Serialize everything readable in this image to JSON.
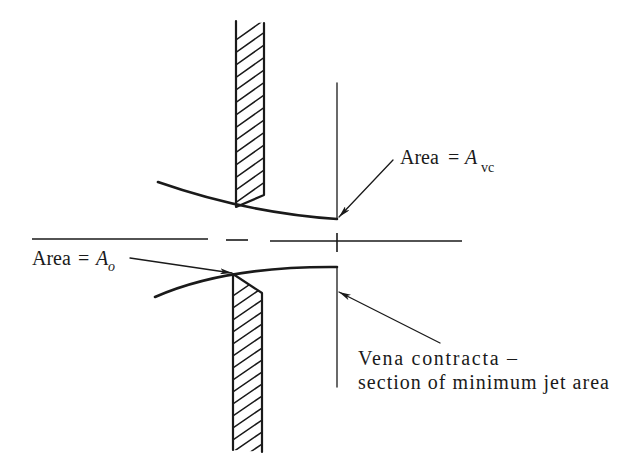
{
  "diagram": {
    "type": "orifice vena contracta schematic",
    "labels": {
      "area_vc": {
        "prefix": "Area",
        "equals": "=",
        "symbol": "A",
        "subscript": "vc"
      },
      "area_o": {
        "prefix": "Area",
        "equals": "=",
        "symbol": "A",
        "subscript": "o"
      },
      "vena_contracta": {
        "line1": "Vena contracta –",
        "line2": "section of minimum jet area"
      }
    },
    "colors": {
      "ink": "#1a1a1a",
      "background": "#ffffff"
    }
  }
}
